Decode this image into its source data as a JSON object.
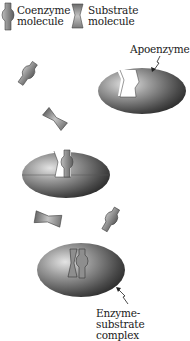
{
  "legend": {
    "coenzyme": {
      "line1": "Coenzyme",
      "line2": "molecule",
      "icon": "coenzyme-icon"
    },
    "substrate": {
      "line1": "Substrate",
      "line2": "molecule",
      "icon": "substrate-icon"
    }
  },
  "labels": {
    "apoenzyme": "Apoenzyme",
    "complex_line1": "Enzyme-substrate",
    "complex_line2": "complex"
  },
  "stages": [
    {
      "name": "apoenzyme",
      "description": "Empty enzyme with binding cleft"
    },
    {
      "name": "enzyme-coenzyme",
      "description": "Enzyme with bound coenzyme"
    },
    {
      "name": "enzyme-substrate-complex",
      "description": "Enzyme with coenzyme and substrate bound"
    }
  ],
  "colors": {
    "enzyme_dark": "#2e2e2e",
    "enzyme_light": "#d8d8d8",
    "molecule_fill": "#9a9a9a",
    "text": "#1a1a1a"
  }
}
